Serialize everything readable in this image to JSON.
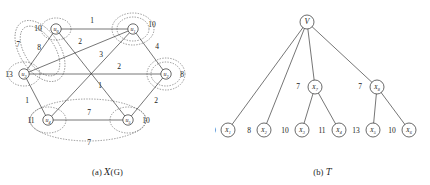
{
  "figure": {
    "panels": [
      {
        "id": "panel-a",
        "caption_prefix": "(a)",
        "caption_symbol": "X",
        "caption_suffix": "(G)"
      },
      {
        "id": "panel-b",
        "caption_prefix": "(b)",
        "caption_symbol": "T",
        "caption_suffix": ""
      }
    ]
  },
  "graph": {
    "title": "X(G)",
    "nodes": [
      {
        "id": "u0",
        "name": "u",
        "sub": "0",
        "value": "10",
        "x": 56,
        "y": 29,
        "value_x": 38,
        "value_y": 31
      },
      {
        "id": "u1",
        "name": "u",
        "sub": "1",
        "value": "10",
        "x": 133,
        "y": 29,
        "value_x": 152,
        "value_y": 27
      },
      {
        "id": "u2",
        "name": "u",
        "sub": "2",
        "value": "8",
        "x": 166,
        "y": 74,
        "value_x": 182,
        "value_y": 77
      },
      {
        "id": "u5",
        "name": "u",
        "sub": "5",
        "value": "10",
        "x": 128,
        "y": 120,
        "value_x": 146,
        "value_y": 123
      },
      {
        "id": "u4",
        "name": "u",
        "sub": "4",
        "value": "11",
        "x": 48,
        "y": 120,
        "value_x": 31,
        "value_y": 123
      },
      {
        "id": "u3",
        "name": "u",
        "sub": "3",
        "value": "13",
        "x": 24,
        "y": 74,
        "value_x": 9,
        "value_y": 77
      }
    ],
    "edges": [
      {
        "from": "u0",
        "to": "u1",
        "weight": "1",
        "label_x": 92,
        "label_y": 23
      },
      {
        "from": "u1",
        "to": "u2",
        "weight": "4",
        "label_x": 157,
        "label_y": 49
      },
      {
        "from": "u2",
        "to": "u5",
        "weight": "2",
        "label_x": 156,
        "label_y": 103
      },
      {
        "from": "u5",
        "to": "u4",
        "weight": "7",
        "label_x": 89,
        "label_y": 115
      },
      {
        "from": "u4",
        "to": "u3",
        "weight": "1",
        "label_x": 27,
        "label_y": 103
      },
      {
        "from": "u3",
        "to": "u0",
        "weight": "8",
        "label_x": 39,
        "label_y": 50
      },
      {
        "from": "u3",
        "to": "u1",
        "weight": "2",
        "label_x": 80,
        "label_y": 44
      },
      {
        "from": "u3",
        "to": "u2",
        "weight": "2",
        "label_x": 119,
        "label_y": 69
      },
      {
        "from": "u0",
        "to": "u5",
        "weight": "3",
        "label_x": 101,
        "label_y": 57
      },
      {
        "from": "u1",
        "to": "u4",
        "weight": "1",
        "label_x": 100,
        "label_y": 88
      }
    ],
    "clusters": [
      {
        "id": "cluster-inner-left",
        "label": "",
        "label_x": 0,
        "label_y": 0
      },
      {
        "id": "cluster-outer-left",
        "label": "7",
        "label_x": 18,
        "label_y": 47
      },
      {
        "id": "cluster-inner-bottom",
        "label": "",
        "label_x": 0,
        "label_y": 0
      },
      {
        "id": "cluster-outer-bottom",
        "label": "7",
        "label_x": 89,
        "label_y": 143
      }
    ]
  },
  "tree": {
    "title": "T",
    "root": {
      "id": "V",
      "name": "V",
      "x": 92,
      "y": 22
    },
    "internal": [
      {
        "id": "X7",
        "name": "X",
        "sub": "7",
        "value": "7",
        "x": 100,
        "y": 87,
        "value_x": 83,
        "value_y": 89
      },
      {
        "id": "X8",
        "name": "X",
        "sub": "8",
        "value": "7",
        "x": 162,
        "y": 87,
        "value_x": 145,
        "value_y": 89
      }
    ],
    "leaves": [
      {
        "id": "X1",
        "name": "X",
        "sub": "1",
        "value": "10",
        "x": 13,
        "y": 130,
        "value_x": -3,
        "value_y": 133,
        "parent": "V"
      },
      {
        "id": "X2",
        "name": "X",
        "sub": "2",
        "value": "8",
        "x": 49,
        "y": 130,
        "value_x": 34,
        "value_y": 133,
        "parent": "V"
      },
      {
        "id": "X3",
        "name": "X",
        "sub": "3",
        "value": "10",
        "x": 87,
        "y": 130,
        "value_x": 70,
        "value_y": 133,
        "parent": "X7"
      },
      {
        "id": "X4",
        "name": "X",
        "sub": "4",
        "value": "11",
        "x": 124,
        "y": 130,
        "value_x": 107,
        "value_y": 133,
        "parent": "X7"
      },
      {
        "id": "X5",
        "name": "X",
        "sub": "5",
        "value": "13",
        "x": 158,
        "y": 130,
        "value_x": 141,
        "value_y": 133,
        "parent": "X8"
      },
      {
        "id": "X6",
        "name": "X",
        "sub": "6",
        "value": "10",
        "x": 194,
        "y": 130,
        "value_x": 177,
        "value_y": 133,
        "parent": "X8"
      }
    ],
    "edges": [
      {
        "from": "V",
        "to": "X1"
      },
      {
        "from": "V",
        "to": "X2"
      },
      {
        "from": "V",
        "to": "X7"
      },
      {
        "from": "V",
        "to": "X8"
      },
      {
        "from": "X7",
        "to": "X3"
      },
      {
        "from": "X7",
        "to": "X4"
      },
      {
        "from": "X8",
        "to": "X5"
      },
      {
        "from": "X8",
        "to": "X6"
      }
    ]
  },
  "colors": {
    "ink": "#1a1a1a",
    "line": "#2b2b2b",
    "cluster": "#555555",
    "background": "#ffffff"
  }
}
